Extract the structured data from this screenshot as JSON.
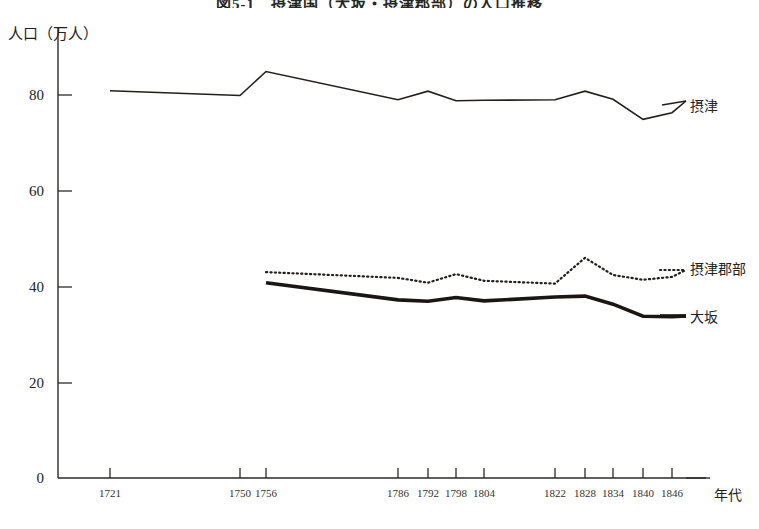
{
  "chart_data": {
    "type": "line",
    "title": "図5-1　摂津国（大坂・摂津郡部）の人口推移",
    "ylabel": "人口（万人）",
    "xlabel": "年代",
    "grid": false,
    "legend_position": "right-inline",
    "ylim": [
      0,
      88
    ],
    "yticks": [
      0,
      20,
      40,
      60,
      80
    ],
    "ytick_labels": [
      "0",
      "20",
      "40",
      "60",
      "80"
    ],
    "categories": [
      "1721",
      "1750",
      "1756",
      "1786",
      "1792",
      "1798",
      "1804",
      "1822",
      "1828",
      "1834",
      "1840",
      "1846"
    ],
    "x": [
      1721,
      1750,
      1756,
      1786,
      1792,
      1798,
      1804,
      1822,
      1828,
      1834,
      1840,
      1846
    ],
    "series": [
      {
        "name": "摂津",
        "style": "solid-thin",
        "color": "#231f1c",
        "x": [
          1721,
          1750,
          1756,
          1786,
          1792,
          1798,
          1804,
          1822,
          1828,
          1834,
          1840,
          1846
        ],
        "values": [
          80.9,
          79.9,
          84.9,
          79.0,
          80.8,
          78.8,
          78.9,
          79.0,
          80.8,
          79.1,
          74.9,
          76.3
        ]
      },
      {
        "name": "摂津郡部",
        "style": "dotted",
        "color": "#231f1c",
        "x": [
          1756,
          1786,
          1792,
          1798,
          1804,
          1822,
          1828,
          1834,
          1840,
          1846
        ],
        "values": [
          43.0,
          41.8,
          40.8,
          42.6,
          41.2,
          40.6,
          46.0,
          42.4,
          41.4,
          42.0
        ]
      },
      {
        "name": "大坂",
        "style": "solid-thick",
        "color": "#1a1614",
        "x": [
          1756,
          1786,
          1792,
          1798,
          1804,
          1822,
          1828,
          1834,
          1840,
          1846
        ],
        "values": [
          40.8,
          37.2,
          36.9,
          37.7,
          37.0,
          37.8,
          38.0,
          36.3,
          33.8,
          33.7
        ]
      }
    ],
    "annotations": []
  },
  "axis": {
    "y_tick_0": "0",
    "y_tick_20": "20",
    "y_tick_40": "40",
    "y_tick_60": "60",
    "y_tick_80": "80",
    "x_tick_1721": "1721",
    "x_tick_1750": "1750",
    "x_tick_1756": "1756",
    "x_tick_1786": "1786",
    "x_tick_1792": "1792",
    "x_tick_1798": "1798",
    "x_tick_1804": "1804",
    "x_tick_1822": "1822",
    "x_tick_1828": "1828",
    "x_tick_1834": "1834",
    "x_tick_1840": "1840",
    "x_tick_1846": "1846"
  },
  "legend": {
    "settsu": "摂津",
    "settsu_gunbu": "摂津郡部",
    "osaka": "大坂"
  }
}
